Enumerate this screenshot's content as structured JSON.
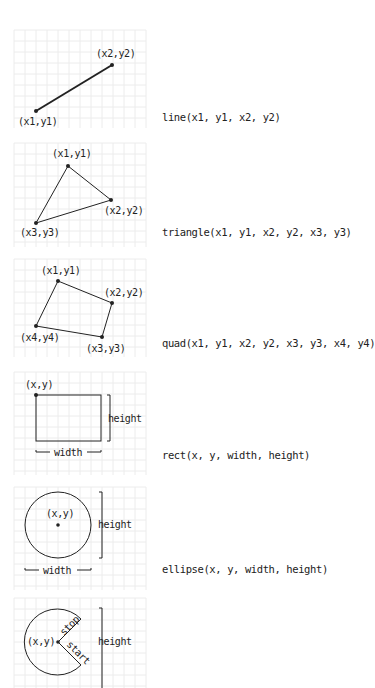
{
  "colors": {
    "grid": "#ececec",
    "stroke": "#222222"
  },
  "panels": [
    {
      "id": "line",
      "function_label": "line(x1, y1, x2, y2)",
      "point_labels": [
        "(x2,y2)",
        "(x1,y1)"
      ]
    },
    {
      "id": "triangle",
      "function_label": "triangle(x1, y1, x2, y2, x3, y3)",
      "point_labels": [
        "(x1,y1)",
        "(x2,y2)",
        "(x3,y3)"
      ]
    },
    {
      "id": "quad",
      "function_label": "quad(x1, y1, x2, y2, x3, y3, x4, y4)",
      "point_labels": [
        "(x1,y1)",
        "(x2,y2)",
        "(x3,y3)",
        "(x4,y4)"
      ]
    },
    {
      "id": "rect",
      "function_label": "rect(x, y, width, height)",
      "point_labels": [
        "(x,y)"
      ],
      "dim_labels": {
        "width": "width",
        "height": "height"
      }
    },
    {
      "id": "ellipse",
      "function_label": "ellipse(x, y, width, height)",
      "point_labels": [
        "(x,y)"
      ],
      "dim_labels": {
        "width": "width",
        "height": "height"
      }
    },
    {
      "id": "arc",
      "point_labels": [
        "(x,y)"
      ],
      "dim_labels": {
        "height": "height"
      },
      "angle_labels": {
        "start": "start",
        "stop": "stop"
      }
    }
  ]
}
